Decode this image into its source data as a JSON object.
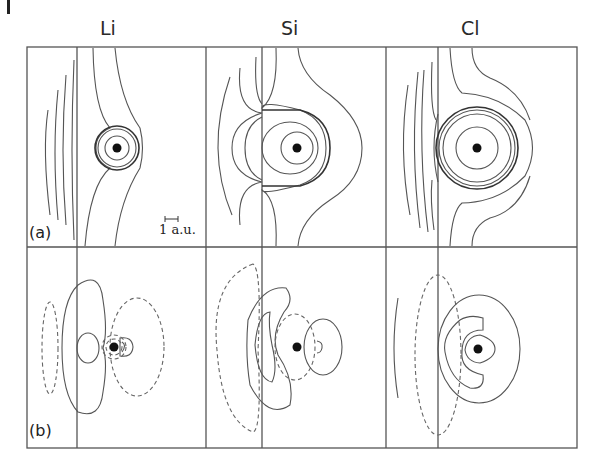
{
  "figure": {
    "columns": [
      {
        "label": "Li"
      },
      {
        "label": "Si"
      },
      {
        "label": "Cl"
      }
    ],
    "rows": [
      {
        "label": "(a)"
      },
      {
        "label": "(b)"
      }
    ],
    "scale_bar": {
      "label": "1 a.u."
    },
    "colors": {
      "line": "#555555",
      "nucleus": "#111111",
      "background": "#ffffff"
    },
    "legend_notes": {
      "solid": "solid contour",
      "dashed": "dashed contour"
    }
  }
}
